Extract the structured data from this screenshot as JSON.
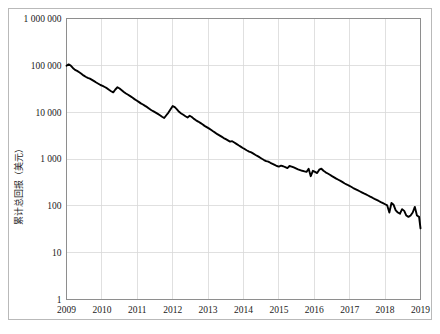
{
  "chart_data": {
    "type": "line",
    "title": "",
    "subtitle": "",
    "xlabel": "",
    "ylabel": "累计总回报（美元）",
    "yscale": "log",
    "ylim": [
      1,
      1000000
    ],
    "xlim": [
      2009,
      2019
    ],
    "grid": true,
    "legend": null,
    "legend_position": "none",
    "y_tick_labels": [
      "1 000 000",
      "100 000",
      "10 000",
      "1 000",
      "100",
      "10",
      "1"
    ],
    "y_tick_values": [
      1000000,
      100000,
      10000,
      1000,
      100,
      10,
      1
    ],
    "x_tick_labels": [
      "2009",
      "2010",
      "2011",
      "2012",
      "2013",
      "2014",
      "2015",
      "2016",
      "2017",
      "2018",
      "2019"
    ],
    "x_tick_values": [
      2009,
      2010,
      2011,
      2012,
      2013,
      2014,
      2015,
      2016,
      2017,
      2018,
      2019
    ],
    "series": [
      {
        "name": "累计总回报",
        "color": "#000000",
        "x": [
          2009.0,
          2009.06,
          2009.12,
          2009.18,
          2009.24,
          2009.3,
          2009.36,
          2009.42,
          2009.48,
          2009.54,
          2009.6,
          2009.66,
          2009.72,
          2009.78,
          2009.84,
          2009.9,
          2009.96,
          2010.02,
          2010.08,
          2010.14,
          2010.2,
          2010.26,
          2010.32,
          2010.38,
          2010.44,
          2010.5,
          2010.56,
          2010.62,
          2010.68,
          2010.74,
          2010.8,
          2010.86,
          2010.92,
          2010.98,
          2011.04,
          2011.1,
          2011.16,
          2011.22,
          2011.28,
          2011.34,
          2011.4,
          2011.46,
          2011.52,
          2011.58,
          2011.64,
          2011.7,
          2011.76,
          2011.82,
          2011.88,
          2011.94,
          2012.0,
          2012.06,
          2012.12,
          2012.18,
          2012.24,
          2012.3,
          2012.36,
          2012.42,
          2012.48,
          2012.54,
          2012.6,
          2012.66,
          2012.72,
          2012.78,
          2012.84,
          2012.9,
          2012.96,
          2013.02,
          2013.08,
          2013.14,
          2013.2,
          2013.26,
          2013.32,
          2013.38,
          2013.44,
          2013.5,
          2013.56,
          2013.62,
          2013.68,
          2013.74,
          2013.8,
          2013.86,
          2013.92,
          2013.98,
          2014.04,
          2014.1,
          2014.16,
          2014.22,
          2014.28,
          2014.34,
          2014.4,
          2014.46,
          2014.52,
          2014.58,
          2014.64,
          2014.7,
          2014.76,
          2014.82,
          2014.88,
          2014.94,
          2015.0,
          2015.06,
          2015.12,
          2015.18,
          2015.24,
          2015.3,
          2015.36,
          2015.42,
          2015.48,
          2015.54,
          2015.6,
          2015.66,
          2015.72,
          2015.78,
          2015.84,
          2015.9,
          2015.96,
          2016.02,
          2016.08,
          2016.14,
          2016.2,
          2016.26,
          2016.32,
          2016.38,
          2016.44,
          2016.5,
          2016.56,
          2016.62,
          2016.68,
          2016.74,
          2016.8,
          2016.86,
          2016.92,
          2016.98,
          2017.04,
          2017.1,
          2017.16,
          2017.22,
          2017.28,
          2017.34,
          2017.4,
          2017.46,
          2017.52,
          2017.58,
          2017.64,
          2017.7,
          2017.76,
          2017.82,
          2017.88,
          2017.94,
          2018.0,
          2018.06,
          2018.12,
          2018.18,
          2018.24,
          2018.3,
          2018.36,
          2018.42,
          2018.48,
          2018.54,
          2018.6,
          2018.66,
          2018.72,
          2018.78,
          2018.84,
          2018.9,
          2018.96,
          2019.0
        ],
        "values": [
          98000,
          105000,
          99000,
          88000,
          80000,
          76000,
          71000,
          66000,
          61000,
          57000,
          54000,
          52000,
          49000,
          46000,
          43000,
          40500,
          38000,
          36500,
          34500,
          32500,
          30000,
          28000,
          26500,
          30500,
          34000,
          32000,
          29500,
          27000,
          25000,
          23500,
          22000,
          20500,
          19000,
          17800,
          16600,
          15400,
          14600,
          13600,
          12800,
          11800,
          11000,
          10400,
          9800,
          9200,
          8600,
          8000,
          7500,
          8600,
          9800,
          11500,
          13500,
          12800,
          11500,
          10200,
          9400,
          8800,
          8200,
          7700,
          8400,
          7900,
          7200,
          6700,
          6300,
          5900,
          5500,
          5100,
          4800,
          4500,
          4200,
          3900,
          3650,
          3400,
          3200,
          3000,
          2800,
          2650,
          2500,
          2350,
          2400,
          2250,
          2100,
          1960,
          1840,
          1720,
          1620,
          1520,
          1440,
          1380,
          1300,
          1220,
          1150,
          1080,
          1010,
          950,
          900,
          880,
          830,
          790,
          750,
          710,
          690,
          720,
          700,
          670,
          640,
          710,
          690,
          660,
          630,
          600,
          580,
          560,
          545,
          530,
          620,
          430,
          560,
          530,
          500,
          590,
          620,
          560,
          520,
          490,
          460,
          430,
          405,
          380,
          360,
          340,
          320,
          300,
          285,
          270,
          255,
          240,
          228,
          216,
          205,
          194,
          184,
          175,
          166,
          157,
          149,
          141,
          134,
          127,
          120,
          114,
          108,
          102,
          72,
          115,
          105,
          80,
          72,
          68,
          85,
          78,
          62,
          58,
          62,
          72,
          95,
          62,
          58,
          33
        ]
      }
    ]
  },
  "axes": {
    "y_title": "累计总回报（美元）"
  }
}
